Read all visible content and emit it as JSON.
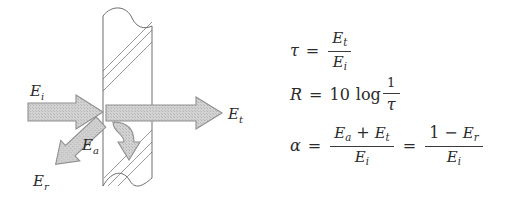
{
  "figure": {
    "background_color": "#ffffff",
    "ink_color": "#4a4a4a",
    "arrow_fill_color": "#c9c9c9",
    "arrow_stroke_color": "#8a8a8a"
  },
  "diagram": {
    "name": "partition-energy-diagram",
    "partition": {
      "name": "wall-partition",
      "hatch_style": "diagonal-lines",
      "break_style": "wavy-break-top-and-bottom"
    },
    "labels": {
      "incident": "E",
      "incident_sub": "i",
      "reflected": "E",
      "reflected_sub": "r",
      "absorbed": "E",
      "absorbed_sub": "a",
      "transmitted": "E",
      "transmitted_sub": "t"
    },
    "arrows": [
      {
        "name": "incident-energy-arrow",
        "label": "E_i",
        "direction": "right"
      },
      {
        "name": "reflected-energy-arrow",
        "label": "E_r",
        "direction": "down-left"
      },
      {
        "name": "absorbed-energy-arrow",
        "label": "E_a",
        "direction": "down"
      },
      {
        "name": "transmitted-energy-arrow",
        "label": "E_t",
        "direction": "right"
      }
    ]
  },
  "equations": {
    "tau": {
      "name": "transmission-coefficient-equation",
      "lhs": "τ",
      "relation": "=",
      "numerator": "E",
      "numerator_sub": "t",
      "denominator": "E",
      "denominator_sub": "i"
    },
    "r": {
      "name": "transmission-loss-equation",
      "lhs": "R",
      "relation": "=",
      "coefficient": "10",
      "operator": "log",
      "numerator": "1",
      "denominator": "τ"
    },
    "alpha": {
      "name": "absorption-coefficient-equation",
      "lhs": "α",
      "relation1": "=",
      "numerator1_a": "E",
      "numerator1_a_sub": "a",
      "plus": "+",
      "numerator1_b": "E",
      "numerator1_b_sub": "t",
      "denominator1": "E",
      "denominator1_sub": "i",
      "relation2": "=",
      "numerator2_a": "1",
      "minus": "−",
      "numerator2_b": "E",
      "numerator2_b_sub": "r",
      "denominator2": "E",
      "denominator2_sub": "i"
    }
  }
}
